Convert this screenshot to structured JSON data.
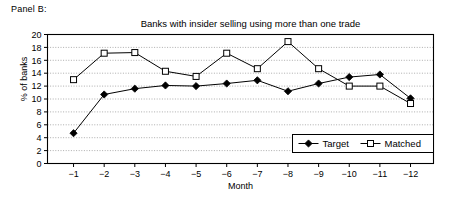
{
  "panel": {
    "label": "Panel B:"
  },
  "chart_data": {
    "type": "line",
    "title": "Banks with insider selling using more than one trade",
    "xlabel": "Month",
    "ylabel": "% of banks",
    "categories": [
      "-1",
      "-2",
      "-3",
      "-4",
      "-5",
      "-6",
      "-7",
      "-8",
      "-9",
      "-10",
      "-11",
      "-12"
    ],
    "yticks": [
      "0",
      "2",
      "4",
      "6",
      "8",
      "10",
      "12",
      "14",
      "16",
      "18",
      "20"
    ],
    "ylim": [
      0,
      20
    ],
    "grid": true,
    "legend_position": "bottom-right",
    "series": [
      {
        "name": "Target",
        "marker": "filled-diamond",
        "color": "#000000",
        "values": [
          4.7,
          10.7,
          11.6,
          12.1,
          12.0,
          12.4,
          12.9,
          11.2,
          12.4,
          13.4,
          13.8,
          10.1
        ]
      },
      {
        "name": "Matched",
        "marker": "open-square",
        "color": "#000000",
        "values": [
          13.0,
          17.1,
          17.2,
          14.3,
          13.5,
          17.1,
          14.7,
          18.9,
          14.7,
          12.0,
          12.0,
          9.3
        ]
      }
    ]
  }
}
